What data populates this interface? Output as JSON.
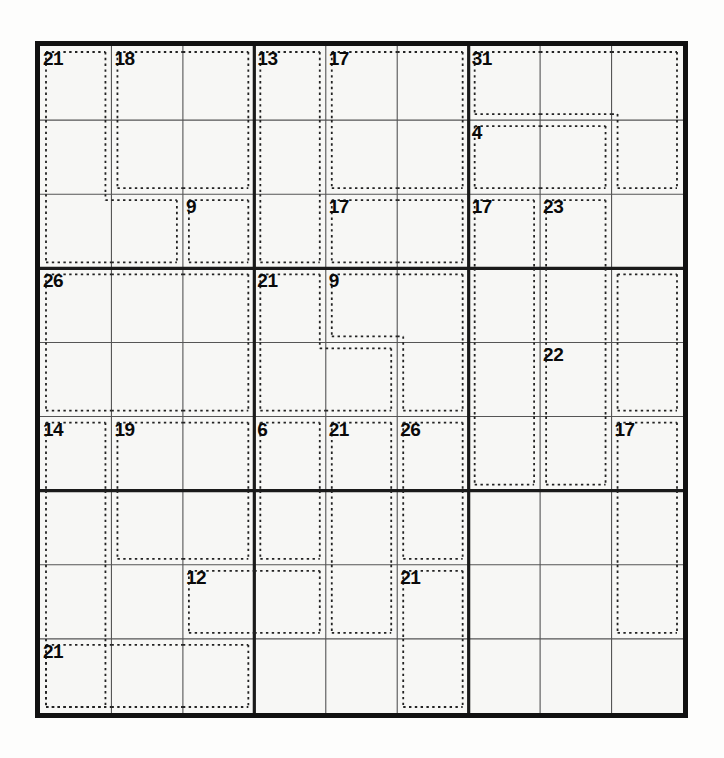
{
  "puzzle": {
    "title": "Killer Sudoku",
    "grid_size": 9,
    "box_size": 3,
    "cell_px": 71.5,
    "origin": {
      "x": 35,
      "y": 41
    },
    "colors": {
      "paper": "#fdfdfc",
      "grid_fill": "#f7f7f5",
      "outer_border": "#111111",
      "box_line": "#1a1a1a",
      "cell_line": "#555555",
      "cage_dash": "#222222",
      "sum_text": "#0a0a0a"
    },
    "line_widths": {
      "outer": 5,
      "box": 3.2,
      "cell": 1.1,
      "cage_dash": 1.8
    },
    "cells": [
      [
        "",
        "",
        "",
        "",
        "",
        "",
        "",
        "",
        ""
      ],
      [
        "",
        "",
        "",
        "",
        "",
        "",
        "",
        "",
        ""
      ],
      [
        "",
        "",
        "",
        "",
        "",
        "",
        "",
        "",
        ""
      ],
      [
        "",
        "",
        "",
        "",
        "",
        "",
        "",
        "",
        ""
      ],
      [
        "",
        "",
        "",
        "",
        "",
        "",
        "",
        "",
        ""
      ],
      [
        "",
        "",
        "",
        "",
        "",
        "",
        "",
        "",
        ""
      ],
      [
        "",
        "",
        "",
        "",
        "",
        "",
        "",
        "",
        ""
      ],
      [
        "",
        "",
        "",
        "",
        "",
        "",
        "",
        "",
        ""
      ],
      [
        "",
        "",
        "",
        "",
        "",
        "",
        "",
        "",
        ""
      ]
    ],
    "cages": [
      {
        "id": "cage-21-r1c1",
        "sum": "21",
        "anchor": {
          "row": 0,
          "col": 0
        },
        "cells": [
          [
            0,
            0
          ],
          [
            1,
            0
          ],
          [
            2,
            0
          ],
          [
            2,
            1
          ]
        ]
      },
      {
        "id": "cage-18-r1c2",
        "sum": "18",
        "anchor": {
          "row": 0,
          "col": 1
        },
        "cells": [
          [
            0,
            1
          ],
          [
            0,
            2
          ],
          [
            1,
            1
          ],
          [
            1,
            2
          ]
        ]
      },
      {
        "id": "cage-13-r1c4",
        "sum": "13",
        "anchor": {
          "row": 0,
          "col": 3
        },
        "cells": [
          [
            0,
            3
          ],
          [
            1,
            3
          ],
          [
            2,
            3
          ]
        ]
      },
      {
        "id": "cage-17-r1c5",
        "sum": "17",
        "anchor": {
          "row": 0,
          "col": 4
        },
        "cells": [
          [
            0,
            4
          ],
          [
            0,
            5
          ],
          [
            1,
            4
          ],
          [
            1,
            5
          ]
        ]
      },
      {
        "id": "cage-31-r1c7",
        "sum": "31",
        "anchor": {
          "row": 0,
          "col": 6
        },
        "cells": [
          [
            0,
            6
          ],
          [
            0,
            7
          ],
          [
            0,
            8
          ],
          [
            1,
            8
          ]
        ]
      },
      {
        "id": "cage-4-r2c7",
        "sum": "4",
        "anchor": {
          "row": 1,
          "col": 6
        },
        "cells": [
          [
            1,
            6
          ],
          [
            1,
            7
          ]
        ]
      },
      {
        "id": "cage-9-r3c3",
        "sum": "9",
        "anchor": {
          "row": 2,
          "col": 2
        },
        "cells": [
          [
            2,
            2
          ]
        ]
      },
      {
        "id": "cage-17-r3c5",
        "sum": "17",
        "anchor": {
          "row": 2,
          "col": 4
        },
        "cells": [
          [
            2,
            4
          ],
          [
            2,
            5
          ]
        ]
      },
      {
        "id": "cage-17-r3c7",
        "sum": "17",
        "anchor": {
          "row": 2,
          "col": 6
        },
        "cells": [
          [
            2,
            6
          ],
          [
            3,
            6
          ],
          [
            4,
            6
          ],
          [
            5,
            6
          ]
        ]
      },
      {
        "id": "cage-23-r3c8",
        "sum": "23",
        "anchor": {
          "row": 2,
          "col": 7
        },
        "cells": [
          [
            2,
            7
          ],
          [
            3,
            7
          ],
          [
            4,
            7
          ],
          [
            5,
            7
          ]
        ]
      },
      {
        "id": "cage-26-r4c1",
        "sum": "26",
        "anchor": {
          "row": 3,
          "col": 0
        },
        "cells": [
          [
            3,
            0
          ],
          [
            3,
            1
          ],
          [
            3,
            2
          ],
          [
            4,
            0
          ],
          [
            4,
            1
          ],
          [
            4,
            2
          ]
        ]
      },
      {
        "id": "cage-21-r4c4",
        "sum": "21",
        "anchor": {
          "row": 3,
          "col": 3
        },
        "cells": [
          [
            3,
            3
          ],
          [
            4,
            3
          ],
          [
            4,
            4
          ]
        ]
      },
      {
        "id": "cage-9-r4c5",
        "sum": "9",
        "anchor": {
          "row": 3,
          "col": 4
        },
        "cells": [
          [
            3,
            4
          ],
          [
            3,
            5
          ],
          [
            4,
            5
          ]
        ]
      },
      {
        "id": "cage-22-r5c8",
        "sum": "22",
        "anchor": {
          "row": 4,
          "col": 7
        },
        "cells": [
          [
            3,
            8
          ],
          [
            4,
            8
          ]
        ]
      },
      {
        "id": "cage-14-r6c1",
        "sum": "14",
        "anchor": {
          "row": 5,
          "col": 0
        },
        "cells": [
          [
            5,
            0
          ],
          [
            6,
            0
          ],
          [
            7,
            0
          ],
          [
            8,
            0
          ]
        ]
      },
      {
        "id": "cage-19-r6c2",
        "sum": "19",
        "anchor": {
          "row": 5,
          "col": 1
        },
        "cells": [
          [
            5,
            1
          ],
          [
            5,
            2
          ],
          [
            6,
            1
          ],
          [
            6,
            2
          ]
        ]
      },
      {
        "id": "cage-6-r6c4",
        "sum": "6",
        "anchor": {
          "row": 5,
          "col": 3
        },
        "cells": [
          [
            5,
            3
          ],
          [
            6,
            3
          ]
        ]
      },
      {
        "id": "cage-21-r6c5",
        "sum": "21",
        "anchor": {
          "row": 5,
          "col": 4
        },
        "cells": [
          [
            5,
            4
          ],
          [
            6,
            4
          ],
          [
            7,
            4
          ]
        ]
      },
      {
        "id": "cage-26-r6c6",
        "sum": "26",
        "anchor": {
          "row": 5,
          "col": 5
        },
        "cells": [
          [
            5,
            5
          ],
          [
            6,
            5
          ]
        ]
      },
      {
        "id": "cage-17-r6c9",
        "sum": "17",
        "anchor": {
          "row": 5,
          "col": 8
        },
        "cells": [
          [
            5,
            8
          ],
          [
            6,
            8
          ],
          [
            7,
            8
          ]
        ]
      },
      {
        "id": "cage-12-r8c3",
        "sum": "12",
        "anchor": {
          "row": 7,
          "col": 2
        },
        "cells": [
          [
            7,
            2
          ],
          [
            7,
            3
          ]
        ]
      },
      {
        "id": "cage-21-r8c6",
        "sum": "21",
        "anchor": {
          "row": 7,
          "col": 5
        },
        "cells": [
          [
            7,
            5
          ],
          [
            8,
            5
          ]
        ]
      },
      {
        "id": "cage-21-r9c1",
        "sum": "21",
        "anchor": {
          "row": 8,
          "col": 0
        },
        "cells": [
          [
            8,
            0
          ],
          [
            8,
            1
          ],
          [
            8,
            2
          ]
        ]
      }
    ],
    "cage_labels": [
      {
        "text": "21",
        "row": 0,
        "col": 0
      },
      {
        "text": "18",
        "row": 0,
        "col": 1
      },
      {
        "text": "13",
        "row": 0,
        "col": 3
      },
      {
        "text": "17",
        "row": 0,
        "col": 4
      },
      {
        "text": "31",
        "row": 0,
        "col": 6
      },
      {
        "text": "4",
        "row": 1,
        "col": 6
      },
      {
        "text": "9",
        "row": 2,
        "col": 2
      },
      {
        "text": "17",
        "row": 2,
        "col": 4
      },
      {
        "text": "17",
        "row": 2,
        "col": 6
      },
      {
        "text": "23",
        "row": 2,
        "col": 7
      },
      {
        "text": "26",
        "row": 3,
        "col": 0
      },
      {
        "text": "21",
        "row": 3,
        "col": 3
      },
      {
        "text": "9",
        "row": 3,
        "col": 4
      },
      {
        "text": "22",
        "row": 4,
        "col": 7
      },
      {
        "text": "14",
        "row": 5,
        "col": 0
      },
      {
        "text": "19",
        "row": 5,
        "col": 1
      },
      {
        "text": "6",
        "row": 5,
        "col": 3
      },
      {
        "text": "21",
        "row": 5,
        "col": 4
      },
      {
        "text": "26",
        "row": 5,
        "col": 5
      },
      {
        "text": "17",
        "row": 5,
        "col": 8
      },
      {
        "text": "12",
        "row": 7,
        "col": 2
      },
      {
        "text": "21",
        "row": 7,
        "col": 5
      },
      {
        "text": "21",
        "row": 8,
        "col": 0
      }
    ]
  }
}
